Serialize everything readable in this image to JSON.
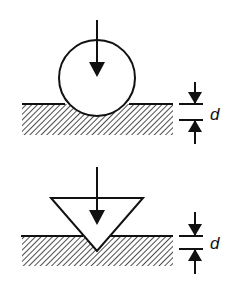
{
  "figure": {
    "panels": [
      {
        "name": "spherical-indenter",
        "indenter_shape": "sphere",
        "depth_label": "d"
      },
      {
        "name": "conical-indenter",
        "indenter_shape": "cone",
        "depth_label": "d"
      }
    ],
    "colors": {
      "stroke": "#111111",
      "background": "#ffffff",
      "hatch": "#222222"
    }
  }
}
